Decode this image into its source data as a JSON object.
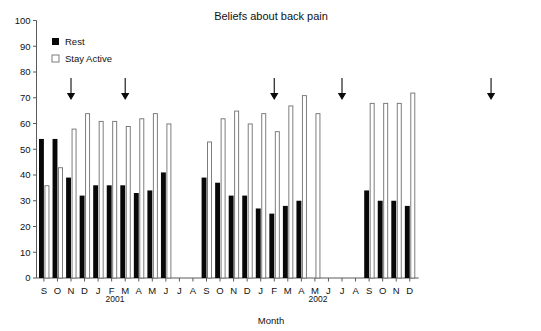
{
  "chart_data": {
    "type": "bar",
    "title": "Beliefs about back pain",
    "xlabel": "Month",
    "ylabel": "",
    "ylim": [
      0,
      100
    ],
    "ytick_step": 10,
    "yticks": [
      0,
      10,
      20,
      30,
      40,
      50,
      60,
      70,
      80,
      90,
      100
    ],
    "grid": false,
    "legend_position": "top-left",
    "categories": [
      "S",
      "O",
      "N",
      "D",
      "J",
      "F",
      "M",
      "A",
      "M",
      "J",
      "J",
      "A",
      "S",
      "O",
      "N",
      "D",
      "J",
      "F",
      "M",
      "A",
      "M",
      "J",
      "J",
      "A",
      "S",
      "O",
      "N",
      "D"
    ],
    "group_labels": [
      "2001",
      "2002"
    ],
    "series": [
      {
        "name": "Rest",
        "color": "#080808",
        "values": [
          54,
          54,
          39,
          32,
          36,
          36,
          36,
          33,
          34,
          41,
          null,
          null,
          39,
          37,
          32,
          32,
          27,
          25,
          28,
          30,
          null,
          null,
          null,
          null,
          34,
          30,
          30,
          28
        ]
      },
      {
        "name": "Stay Active",
        "color": "#ffffff",
        "values": [
          36,
          43,
          58,
          64,
          61,
          61,
          59,
          62,
          64,
          60,
          null,
          null,
          53,
          62,
          65,
          60,
          64,
          57,
          67,
          71,
          64,
          null,
          null,
          null,
          68,
          68,
          68,
          72
        ]
      }
    ],
    "annotations": [
      {
        "type": "arrow",
        "direction": "down",
        "at_category_index": 2,
        "label": ""
      },
      {
        "type": "arrow",
        "direction": "down",
        "at_category_index": 6,
        "label": ""
      },
      {
        "type": "arrow",
        "direction": "down",
        "at_category_index": 17,
        "label": ""
      },
      {
        "type": "arrow",
        "direction": "down",
        "at_category_index": 22,
        "label": ""
      },
      {
        "type": "arrow",
        "direction": "down",
        "at_category_index": 33,
        "label": ""
      }
    ]
  },
  "legend": {
    "items": [
      {
        "label": "Rest",
        "marker": "filled-square"
      },
      {
        "label": "Stay Active",
        "marker": "open-square"
      }
    ]
  },
  "axis": {
    "x_title": "Month",
    "group_1": "2001",
    "group_2": "2002"
  }
}
